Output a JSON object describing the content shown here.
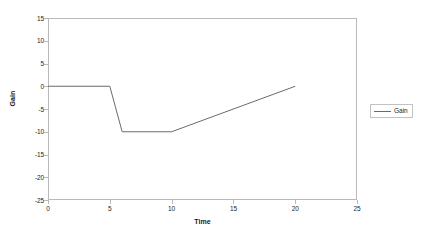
{
  "chart_data": {
    "type": "line",
    "title": "",
    "xlabel": "Time",
    "ylabel": "Gain",
    "xlim": [
      0,
      25
    ],
    "ylim": [
      -25,
      15
    ],
    "xticks": [
      0,
      5,
      10,
      15,
      20,
      25
    ],
    "yticks": [
      15,
      10,
      5,
      0,
      -5,
      -10,
      -15,
      -20,
      -25
    ],
    "grid": false,
    "legend_position": "right",
    "series": [
      {
        "name": "Gain",
        "color": "#6b6b6b",
        "x": [
          0,
          5,
          6,
          10,
          20
        ],
        "values": [
          0,
          0,
          -10,
          -10,
          0
        ]
      }
    ]
  },
  "axes": {
    "y_tick_labels": [
      "15",
      "10",
      "5",
      "0",
      "-5",
      "-10",
      "-15",
      "-20",
      "-25"
    ],
    "x_tick_labels": [
      "0",
      "5",
      "10",
      "15",
      "20",
      "25"
    ],
    "y_axis_title": "Gain",
    "x_axis_title": "Time"
  },
  "legend": {
    "entries": [
      {
        "label": "Gain",
        "color": "#6b6b6b"
      }
    ]
  },
  "colors": {
    "series_line": "#6b6b6b",
    "axis": "#b9b9b9",
    "text": "#242424",
    "background": "#ffffff"
  }
}
